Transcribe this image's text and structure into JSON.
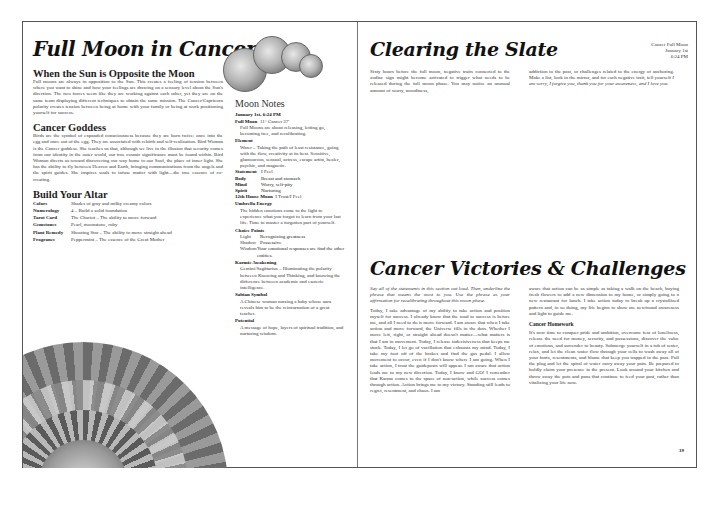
{
  "left_page": {
    "title": "Full Moon in Cancer",
    "sections": [
      {
        "heading": "When the Sun is Opposite the Moon",
        "body": "Full moons are always in opposition to the Sun. This creates a feeling of tension between where you want to shine and how your feelings are drawing on a sensory level about the Sun's direction. The two forces seem like they are working against each other, yet they are on the same team displaying different techniques to obtain the same mission. The Cancer/Capricorn polarity creates tension between being at home with your family or being at work positioning yourself for success."
      },
      {
        "heading": "Cancer Goddess",
        "body": "Birds are the symbol of expanded consciousness because they are born twice; once into the egg and once out of the egg. They are associated with rebirth and self-realization. Bird Woman is the Cancer goddess. She teaches us that, although we live in the illusion that security comes from our identity in the outer world, our true cosmic significance must be found within. Bird Woman directs us toward discovering our way home to our Soul, the place of inner light. She has the ability to fly between Heaven and Earth, bringing communications from the angels and the spirit guides. She inspires souls to infuse matter with light—the true essence of co-creating."
      }
    ],
    "altar": {
      "heading": "Build Your Altar",
      "rows": [
        {
          "key": "Colors",
          "value": "Shades of gray and milky creamy colors"
        },
        {
          "key": "Numerology",
          "value": "4 – Build a solid foundation"
        },
        {
          "key": "Tarot Card",
          "value": "The Chariot – The ability to move forward"
        },
        {
          "key": "Gemstones",
          "value": "Pearl, moonstone, ruby"
        },
        {
          "key": "Plant Remedy",
          "value": "Shooting Star – The ability to move straight ahead"
        },
        {
          "key": "Fragrance",
          "value": "Peppermint – The essence of the Great Mother"
        }
      ]
    },
    "moon_notes": {
      "title": "Moon Notes",
      "datetime": "January 1st, 6:24 PM",
      "full_moon_label": "Full Moon",
      "full_moon_value": "11° Cancer 37'",
      "full_moon_desc": "Full Moons are about releasing, letting go, becoming free, and recalibrating.",
      "element_label": "Element",
      "element_desc": "Water – Taking the path of least resistance, going with the flow, creativity at its best. Sensitive, glamourous, sensual, actress, escape artist, healer, psychic, and magnetic.",
      "kv": [
        {
          "key": "Statement",
          "value": "I Feel"
        },
        {
          "key": "Body",
          "value": "Breast and stomach"
        },
        {
          "key": "Mind",
          "value": "Worry, self-pity"
        },
        {
          "key": "Spirit",
          "value": "Nurturing"
        }
      ],
      "house_label": "12th House Moon",
      "house_value": "I Trust/I Feel",
      "umbrella_label": "Umbrella Energy",
      "umbrella_desc": "The hidden emotions come to the light to experience what you forgot to learn from your last life. Time to master a forgotten part of yourself.",
      "choice_label": "Choice Points",
      "choice": [
        {
          "key": "Light",
          "value": "Recognizing greatness"
        },
        {
          "key": "Shadow",
          "value": "Possessive"
        },
        {
          "key": "Wisdom",
          "value": "Your emotional responses are find the other entities."
        }
      ],
      "karmic_label": "Karmic Awakening",
      "karmic_desc": "Gemini/Sagittarius – Illuminating the polarity between Knowing and Thinking, and knowing the difference between academic and esoteric intelligence.",
      "sabian_label": "Sabian Symbol",
      "sabian_desc": "A Chinese woman nursing a baby whose aura reveals him to be the reincarnation of a great teacher.",
      "potential_label": "Potential",
      "potential_desc": "A message of hope, layers of spiritual tradition, and nurturing wisdom."
    }
  },
  "right_page": {
    "title1": "Clearing the Slate",
    "stamp": [
      "Cancer Full Moon",
      "January 1st",
      "6:24 PM"
    ],
    "slate_col1": "Sixty hours before the full moon, negative traits connected to the zodiac sign might become activated to trigger what needs to be released during the full moon phase. You may notice an unusual amount of worry, moodiness,",
    "slate_col2_a": "addiction to the past, or challenges related to the energy of anchoring. Make a list, look in the mirror, and for each negative trait, tell yourself ",
    "slate_col2_b": "I am sorry, I forgive you, thank you for your awareness, and I love you.",
    "title2": "Cancer Victories & Challenges",
    "vic_intro": "Say all of the statements in this section out loud. Then, underline the phrase that means the most to you. Use the phrase as your affirmation for recalibrating throughout this moon phase.",
    "vic_col1": "Today, I take advantage of my ability to take action and position myself for success. I already know that the road to success is before me, and all I need to do is move forward. I am aware that when I take action and move forward, the Universe fills in the dots. Whether I move left, right, or straight ahead doesn't matter—what matters is that I am in movement. Today, I release indecisiveness that keeps me stuck. Today, I let go of vacillation that exhausts my mind. Today, I take my foot off of the brakes and find the gas pedal. I allow movement to occur, even if I don't know where I am going. When I take action, I trust the guideposts will appear. I am aware that action leads me to my new direction. Today, I know and GO! I remember that Karma comes to the space of non-action, while success comes through action. Action brings me to my victory. Standing still leads to regret, resentment, and chaos. I am",
    "vic_col2": "aware that action can be as simple as taking a walk on the beach, buying fresh flowers to add a new dimension to my home, or simply going to a new restaurant for lunch. I take action today to break up a crystallized pattern and, in so doing, my life begins to show me newfound awareness and light to guide me.",
    "homework_label": "Cancer Homework",
    "homework": "It's now time to conquer pride and ambition, overcome fear of loneliness, release the need for money, security, and possessions, discover the value of emotions, and surrender to beauty. Submerge yourself in a tub of water, relax, and let the clean water flow through your cells to wash away all of your hurts, resentments, and blame that keep you trapped in the past. Pull the plug and let the spiral of water carry away your pain. Be prepared to boldly claim your presence in the present. Look around your kitchen and throw away the pots and pans that continue to feed your past, rather than vitalizing your life now.",
    "page_number": "19"
  }
}
